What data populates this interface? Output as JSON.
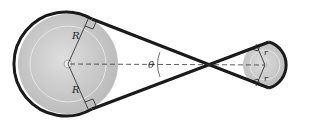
{
  "diagram": {
    "type": "crossed-belt-pulley",
    "labels": {
      "large_radius_top": "R",
      "large_radius_bottom": "R",
      "small_radius_top": "r",
      "small_radius_bottom": "r",
      "angle": "θ"
    },
    "colors": {
      "belt": "#1a1a1a",
      "pulley_fill": "#c8c8c8",
      "pulley_inner": "#d6d6d6",
      "background": "#ffffff"
    }
  }
}
